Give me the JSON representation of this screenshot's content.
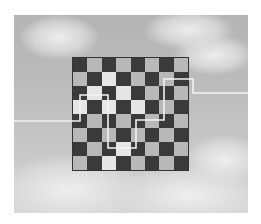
{
  "scene": {
    "description": "Checkerboard floating over a cloudy sky with a white path line crossing it",
    "board": {
      "rows": 8,
      "cols": 8,
      "top_left": "dark",
      "dark_color": "#3a3a3a",
      "light_color": "#b8b8b8"
    },
    "path_color": "#f2f2f2",
    "path_points": [
      [
        14,
        121
      ],
      [
        80,
        121
      ],
      [
        80,
        95
      ],
      [
        108,
        95
      ],
      [
        108,
        148
      ],
      [
        136,
        148
      ],
      [
        136,
        120
      ],
      [
        164,
        120
      ],
      [
        164,
        79
      ],
      [
        193,
        79
      ],
      [
        193,
        93
      ],
      [
        248,
        93
      ]
    ]
  }
}
